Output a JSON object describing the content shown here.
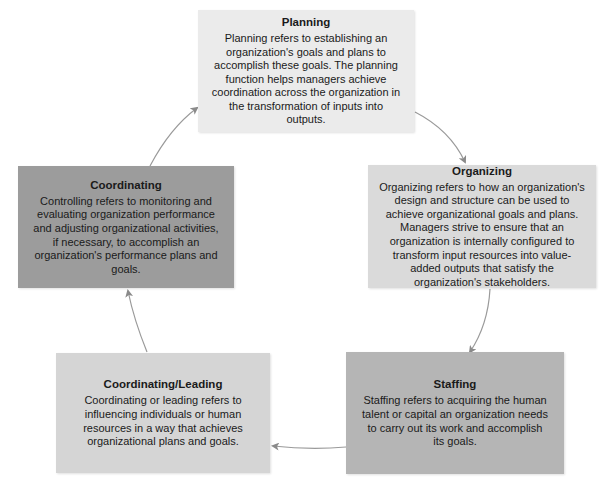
{
  "diagram": {
    "type": "cycle",
    "nodes": [
      {
        "id": "planning",
        "title": "Planning",
        "description": "Planning refers to establishing an organization's goals and plans to accomplish these goals. The planning function helps managers achieve coordination across the organization in the transformation of inputs into outputs.",
        "fill": "#ebebeb"
      },
      {
        "id": "organizing",
        "title": "Organizing",
        "description": "Organizing refers to how an organization's design and structure can be used to achieve organizational goals and plans. Managers strive to ensure that an organization is internally configured to transform input resources into value-added outputs that satisfy the organization's stakeholders.",
        "fill": "#dadada"
      },
      {
        "id": "staffing",
        "title": "Staffing",
        "description": "Staffing refers to acquiring the human talent or capital an organization needs to carry out its work and accomplish its goals.",
        "fill": "#b5b5b5"
      },
      {
        "id": "coordinating-leading",
        "title": "Coordinating/Leading",
        "description": "Coordinating or leading refers to influencing individuals or human resources in a way that achieves organizational plans and goals.",
        "fill": "#d5d5d5"
      },
      {
        "id": "coordinating",
        "title": "Coordinating",
        "description": "Controlling refers to monitoring and evaluating organization performance and adjusting organizational activities, if necessary, to accomplish an organization's performance plans and goals.",
        "fill": "#9c9c9c"
      }
    ],
    "edges": [
      {
        "from": "planning",
        "to": "organizing"
      },
      {
        "from": "organizing",
        "to": "staffing"
      },
      {
        "from": "staffing",
        "to": "coordinating-leading"
      },
      {
        "from": "coordinating-leading",
        "to": "coordinating"
      },
      {
        "from": "coordinating",
        "to": "planning"
      }
    ],
    "arrow_color": "#8a8a8a"
  }
}
